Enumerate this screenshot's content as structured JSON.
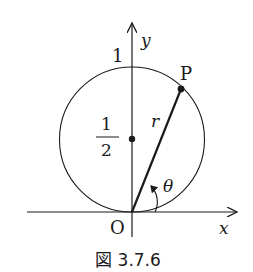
{
  "figure": {
    "caption": "図 3.7.6",
    "labels": {
      "y_axis": "y",
      "x_axis": "x",
      "origin": "O",
      "y_tick_1": "1",
      "half_numerator": "1",
      "half_denominator": "2",
      "point": "P",
      "radius": "r",
      "angle": "θ"
    },
    "colors": {
      "stroke": "#1a1a1a",
      "background": "#ffffff"
    }
  }
}
